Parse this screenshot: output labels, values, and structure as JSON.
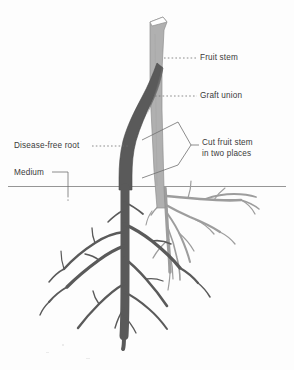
{
  "figure": {
    "type": "botanical-diagram",
    "labels": {
      "fruit_stem": "Fruit stem",
      "graft_union": "Graft union",
      "cut_fruit_stem": "Cut fruit stem\nin two places",
      "disease_free_root": "Disease-free root",
      "medium": "Medium"
    },
    "colors": {
      "fruit_stem_fill": "#b0b0b0",
      "fruit_stem_edge": "#8f8f8f",
      "rootstock_fill": "#5a5a5a",
      "rootstock_edge": "#4a4a4a",
      "light_root_fill": "#9d9d9d",
      "leader_line": "#6e6e6e",
      "medium_line": "#8a8a8a",
      "label_text": "#3a3a3a",
      "background": "#fdfdfd"
    },
    "parts": [
      {
        "name": "fruit-stem",
        "shade": "light",
        "description": "upright light gray scion stem with angled cut top"
      },
      {
        "name": "graft-union",
        "shade": "mixed",
        "description": "point where dark rootstock meets light fruit stem"
      },
      {
        "name": "rootstock-stem",
        "shade": "dark",
        "description": "dark gray disease-free rootstock curving up to graft"
      },
      {
        "name": "cut-marks",
        "shade": "line",
        "description": "two diagonal cut lines across the fruit stem below the graft"
      },
      {
        "name": "medium-line",
        "shade": "line",
        "description": "horizontal soil surface line across the figure"
      },
      {
        "name": "dark-root-system",
        "shade": "dark",
        "description": "disease-free rootstock root system below medium"
      },
      {
        "name": "light-root-system",
        "shade": "light",
        "description": "original fruit stem root system below medium"
      }
    ]
  }
}
